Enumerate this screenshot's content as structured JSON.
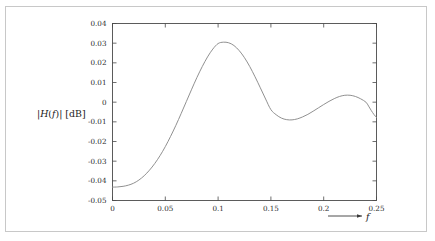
{
  "figure": {
    "background_color": "#ffffff",
    "border_color": "#c8c8c8",
    "axis_color": "#4a4a4a",
    "curve_color": "#8a8a8a"
  },
  "axes": {
    "y_title_parts": {
      "bar_open": "|",
      "h_symbol": "H",
      "paren_open": "(",
      "f_symbol": "f",
      "paren_close": ")",
      "bar_close": "|",
      "unit": " [dB]"
    },
    "y_title_full": "|H(f)| [dB]",
    "x_title": "f",
    "x_arrow": "arrow-right-icon",
    "y_tick_labels": [
      "0.04",
      "0.03",
      "0.02",
      "0.01",
      "0",
      "-0.01",
      "-0.02",
      "-0.03",
      "-0.04",
      "-0.05"
    ],
    "x_tick_labels": [
      "0",
      "0.05",
      "0.1",
      "0.15",
      "0.2",
      "0.25"
    ]
  },
  "chart_data": {
    "type": "line",
    "title": "",
    "xlabel": "f",
    "ylabel": "|H(f)| [dB]",
    "xlim": [
      0,
      0.25
    ],
    "ylim": [
      -0.05,
      0.04
    ],
    "grid": false,
    "legend": "none",
    "xticks": [
      0,
      0.05,
      0.1,
      0.15,
      0.2,
      0.25
    ],
    "yticks": [
      0.04,
      0.03,
      0.02,
      0.01,
      0,
      -0.01,
      -0.02,
      -0.03,
      -0.04,
      -0.05
    ],
    "series": [
      {
        "name": "|H(f)|",
        "color": "#8a8a8a",
        "x": [
          0.0,
          0.005,
          0.01,
          0.015,
          0.02,
          0.025,
          0.03,
          0.035,
          0.04,
          0.045,
          0.05,
          0.055,
          0.06,
          0.065,
          0.07,
          0.075,
          0.08,
          0.085,
          0.09,
          0.095,
          0.1,
          0.105,
          0.11,
          0.115,
          0.12,
          0.125,
          0.13,
          0.135,
          0.14,
          0.145,
          0.15,
          0.155,
          0.16,
          0.165,
          0.17,
          0.175,
          0.18,
          0.185,
          0.19,
          0.195,
          0.2,
          0.205,
          0.21,
          0.215,
          0.22,
          0.225,
          0.23,
          0.235,
          0.24,
          0.2425,
          0.245,
          0.2475,
          0.25
        ],
        "y": [
          -0.0432,
          -0.0431,
          -0.0428,
          -0.0422,
          -0.0412,
          -0.0396,
          -0.0374,
          -0.0346,
          -0.0312,
          -0.0272,
          -0.0226,
          -0.0174,
          -0.0118,
          -0.0058,
          0.0004,
          0.0066,
          0.0126,
          0.0181,
          0.023,
          0.027,
          0.0298,
          0.0305,
          0.0302,
          0.0288,
          0.0262,
          0.0226,
          0.0181,
          0.0129,
          0.0073,
          0.0016,
          -0.0038,
          -0.0064,
          -0.0081,
          -0.0089,
          -0.009,
          -0.0085,
          -0.0075,
          -0.0062,
          -0.0046,
          -0.0029,
          -0.0012,
          0.0004,
          0.0018,
          0.0029,
          0.0035,
          0.0035,
          0.0029,
          0.0017,
          0.0,
          -0.002,
          -0.0042,
          -0.0062,
          -0.0078
        ]
      }
    ],
    "annotations": [
      {
        "name": "passband-peak",
        "x": 0.107,
        "y": 0.0305
      },
      {
        "name": "first-ripple-min",
        "x": 0.168,
        "y": -0.009
      },
      {
        "name": "second-ripple-max",
        "x": 0.2225,
        "y": 0.0035
      }
    ]
  }
}
